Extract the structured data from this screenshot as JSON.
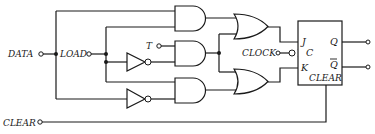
{
  "diagram": {
    "type": "logic-circuit",
    "inputs": {
      "data": "DATA",
      "load": "LOAD",
      "t": "T",
      "clock": "CLOCK",
      "clear": "CLEAR"
    },
    "flipflop": {
      "j": "J",
      "c": "C",
      "k": "K",
      "q": "Q",
      "qbar": "Q",
      "clear": "CLEAR"
    },
    "gates": [
      {
        "id": "and1",
        "kind": "AND"
      },
      {
        "id": "and2",
        "kind": "AND"
      },
      {
        "id": "and3",
        "kind": "AND"
      },
      {
        "id": "or1",
        "kind": "OR"
      },
      {
        "id": "or2",
        "kind": "OR"
      },
      {
        "id": "not1",
        "kind": "NOT"
      },
      {
        "id": "not2",
        "kind": "NOT"
      }
    ],
    "colors": {
      "line": "#1a1a1a",
      "background": "#ffffff"
    }
  }
}
